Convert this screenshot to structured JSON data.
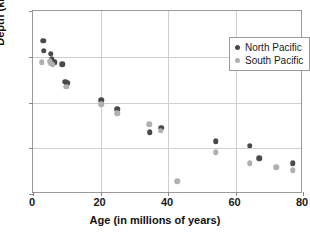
{
  "chart_data": {
    "type": "scatter",
    "title": "",
    "xlabel": "Age (in millions of years)",
    "ylabel": "Depth (km)",
    "xlim": [
      0,
      80
    ],
    "ylim": [
      2,
      6
    ],
    "y_inverted": true,
    "grid": true,
    "legend_position": "top-right",
    "x_ticks": [
      0,
      20,
      40,
      60,
      80
    ],
    "y_ticks": [
      2,
      3,
      4,
      5,
      6
    ],
    "series": [
      {
        "name": "North Pacific",
        "color": "#4a4a4a",
        "points": [
          {
            "x": 3.0,
            "y": 2.65
          },
          {
            "x": 3.2,
            "y": 2.87
          },
          {
            "x": 5.2,
            "y": 2.93
          },
          {
            "x": 5.6,
            "y": 3.05
          },
          {
            "x": 6.4,
            "y": 3.12
          },
          {
            "x": 8.6,
            "y": 3.16
          },
          {
            "x": 9.6,
            "y": 3.55
          },
          {
            "x": 10.2,
            "y": 3.57
          },
          {
            "x": 10.0,
            "y": 3.62
          },
          {
            "x": 20.2,
            "y": 3.95
          },
          {
            "x": 25.0,
            "y": 4.15
          },
          {
            "x": 34.6,
            "y": 4.65
          },
          {
            "x": 38.0,
            "y": 4.55
          },
          {
            "x": 54.2,
            "y": 4.85
          },
          {
            "x": 64.2,
            "y": 4.95
          },
          {
            "x": 67.0,
            "y": 5.22
          },
          {
            "x": 77.0,
            "y": 5.33
          }
        ]
      },
      {
        "name": "South Pacific",
        "color": "#b0b0b0",
        "points": [
          {
            "x": 2.6,
            "y": 3.12
          },
          {
            "x": 5.0,
            "y": 3.1
          },
          {
            "x": 5.4,
            "y": 3.15
          },
          {
            "x": 5.8,
            "y": 3.18
          },
          {
            "x": 9.8,
            "y": 3.66
          },
          {
            "x": 20.2,
            "y": 4.04
          },
          {
            "x": 25.0,
            "y": 4.23
          },
          {
            "x": 34.4,
            "y": 4.48
          },
          {
            "x": 37.8,
            "y": 4.62
          },
          {
            "x": 42.8,
            "y": 5.72
          },
          {
            "x": 54.2,
            "y": 5.09
          },
          {
            "x": 64.2,
            "y": 5.33
          },
          {
            "x": 72.0,
            "y": 5.41
          },
          {
            "x": 77.0,
            "y": 5.48
          }
        ]
      }
    ]
  }
}
